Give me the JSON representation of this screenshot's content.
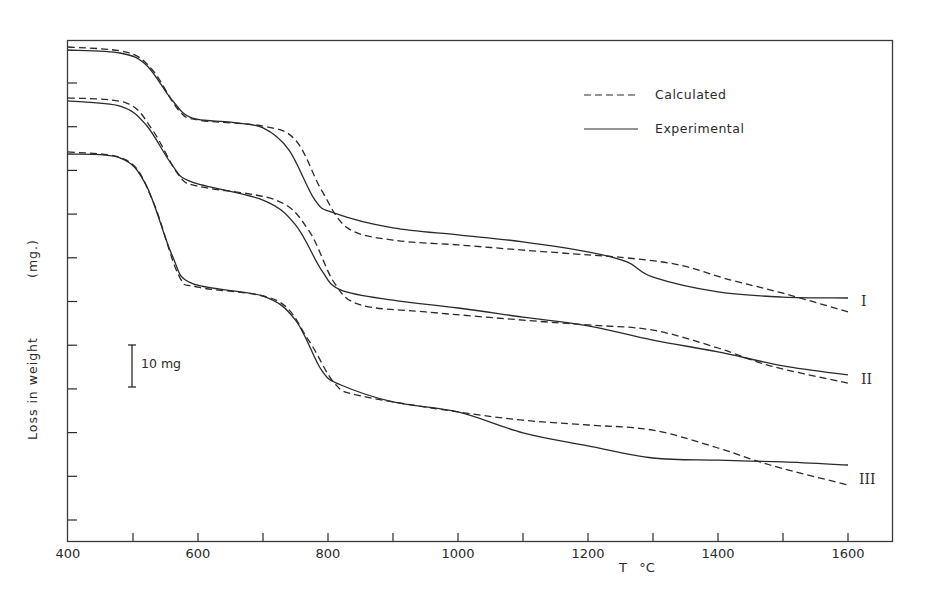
{
  "chart_data": {
    "type": "line",
    "title": "",
    "xlabel": "T  °C",
    "ylabel": "Loss in weight    (mg.)",
    "xlim": [
      400,
      1640
    ],
    "x_ticks_labeled": [
      400,
      600,
      800,
      1000,
      1200,
      1400,
      1600
    ],
    "x_ticks_minor": [
      500,
      700,
      900,
      1100,
      1300,
      1500
    ],
    "x_tick_labels": [
      "400",
      "600",
      "800",
      "1000",
      "1200",
      "1400",
      "1600"
    ],
    "y_tick_spacing_mg": 10,
    "y_ticks_count": 11,
    "y_unit_note": "values are loss in weight in mg, measured downward from top of frame (relative offsets; curves are vertically displaced for clarity)",
    "ylim": [
      0,
      115
    ],
    "grid": false,
    "legend_position": "upper right",
    "legend": [
      {
        "label": "Calculated",
        "style": "dashed"
      },
      {
        "label": "Experimental",
        "style": "solid"
      }
    ],
    "scale_bar": {
      "label": "10 mg",
      "value_mg": 10,
      "x": 500
    },
    "x": [
      400,
      480,
      520,
      560,
      600,
      700,
      750,
      790,
      820,
      900,
      1000,
      1100,
      1200,
      1300,
      1400,
      1500,
      1600
    ],
    "series": [
      {
        "name": "I Experimental",
        "curve": "I",
        "style": "solid",
        "points": [
          [
            400,
            2.3
          ],
          [
            480,
            3.0
          ],
          [
            520,
            5.7
          ],
          [
            560,
            13.8
          ],
          [
            590,
            17.9
          ],
          [
            650,
            18.9
          ],
          [
            700,
            20.2
          ],
          [
            740,
            25.3
          ],
          [
            780,
            36.8
          ],
          [
            810,
            39.8
          ],
          [
            900,
            43.2
          ],
          [
            1000,
            44.8
          ],
          [
            1100,
            46.4
          ],
          [
            1200,
            48.7
          ],
          [
            1260,
            51.0
          ],
          [
            1300,
            54.5
          ],
          [
            1400,
            57.9
          ],
          [
            1500,
            59.1
          ],
          [
            1600,
            59.3
          ]
        ]
      },
      {
        "name": "I Calculated",
        "curve": "I",
        "style": "dashed",
        "points": [
          [
            400,
            1.6
          ],
          [
            490,
            2.8
          ],
          [
            530,
            6.9
          ],
          [
            570,
            16.1
          ],
          [
            600,
            18.4
          ],
          [
            700,
            19.8
          ],
          [
            750,
            23.0
          ],
          [
            790,
            34.5
          ],
          [
            830,
            43.2
          ],
          [
            900,
            46.0
          ],
          [
            1000,
            47.1
          ],
          [
            1100,
            48.3
          ],
          [
            1200,
            49.4
          ],
          [
            1260,
            50.1
          ],
          [
            1340,
            51.7
          ],
          [
            1420,
            55.2
          ],
          [
            1500,
            58.2
          ],
          [
            1600,
            62.5
          ]
        ]
      },
      {
        "name": "II Experimental",
        "curve": "II",
        "style": "solid",
        "points": [
          [
            400,
            14.0
          ],
          [
            480,
            15.2
          ],
          [
            520,
            19.5
          ],
          [
            560,
            28.7
          ],
          [
            590,
            32.6
          ],
          [
            700,
            36.8
          ],
          [
            750,
            42.5
          ],
          [
            790,
            52.9
          ],
          [
            820,
            57.5
          ],
          [
            900,
            59.8
          ],
          [
            1000,
            61.6
          ],
          [
            1100,
            63.7
          ],
          [
            1200,
            65.7
          ],
          [
            1300,
            69.0
          ],
          [
            1400,
            71.7
          ],
          [
            1500,
            74.9
          ],
          [
            1600,
            77.0
          ]
        ]
      },
      {
        "name": "II Calculated",
        "curve": "II",
        "style": "dashed",
        "points": [
          [
            400,
            13.3
          ],
          [
            490,
            14.5
          ],
          [
            530,
            20.7
          ],
          [
            570,
            31.0
          ],
          [
            600,
            33.6
          ],
          [
            720,
            36.8
          ],
          [
            770,
            43.7
          ],
          [
            810,
            55.9
          ],
          [
            850,
            60.9
          ],
          [
            950,
            62.5
          ],
          [
            1100,
            64.4
          ],
          [
            1200,
            65.5
          ],
          [
            1300,
            66.7
          ],
          [
            1400,
            70.8
          ],
          [
            1480,
            74.9
          ],
          [
            1600,
            78.9
          ]
        ]
      },
      {
        "name": "III Experimental",
        "curve": "III",
        "style": "solid",
        "points": [
          [
            400,
            26.2
          ],
          [
            480,
            27.1
          ],
          [
            520,
            33.3
          ],
          [
            560,
            49.4
          ],
          [
            590,
            55.9
          ],
          [
            700,
            58.9
          ],
          [
            750,
            64.4
          ],
          [
            790,
            75.9
          ],
          [
            820,
            79.3
          ],
          [
            900,
            83.2
          ],
          [
            1000,
            85.5
          ],
          [
            1100,
            90.3
          ],
          [
            1200,
            93.3
          ],
          [
            1300,
            96.1
          ],
          [
            1400,
            96.6
          ],
          [
            1500,
            97.0
          ],
          [
            1600,
            97.7
          ]
        ]
      },
      {
        "name": "III Calculated",
        "curve": "III",
        "style": "dashed",
        "points": [
          [
            400,
            25.7
          ],
          [
            490,
            27.6
          ],
          [
            530,
            36.8
          ],
          [
            570,
            54.0
          ],
          [
            600,
            56.8
          ],
          [
            720,
            59.8
          ],
          [
            770,
            69.0
          ],
          [
            810,
            78.9
          ],
          [
            850,
            81.8
          ],
          [
            1000,
            85.5
          ],
          [
            1100,
            87.4
          ],
          [
            1200,
            88.5
          ],
          [
            1300,
            89.7
          ],
          [
            1400,
            93.8
          ],
          [
            1480,
            97.7
          ],
          [
            1600,
            102.3
          ]
        ]
      }
    ],
    "curve_labels": [
      "I",
      "II",
      "III"
    ]
  },
  "labels": {
    "x_axis_title": "T   °C",
    "y_axis_title_main": "Loss in weight",
    "y_axis_title_unit": "(mg.)",
    "legend_calculated": "Calculated",
    "legend_experimental": "Experimental",
    "scale_bar": "10 mg",
    "curve_I": "I",
    "curve_II": "II",
    "curve_III": "III"
  },
  "colors": {
    "ink": "#2a2a2a",
    "background": "#ffffff"
  }
}
